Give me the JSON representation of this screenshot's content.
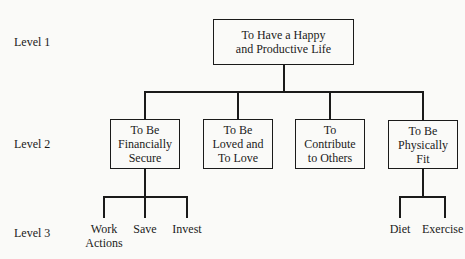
{
  "levels": [
    "Level 1",
    "Level 2",
    "Level 3"
  ],
  "root": {
    "label": "To Have a Happy\nand Productive Life"
  },
  "level2": [
    {
      "label": "To Be\nFinancially\nSecure"
    },
    {
      "label": "To Be\nLoved and\nTo Love"
    },
    {
      "label": "To\nContribute\nto Others"
    },
    {
      "label": "To Be\nPhysically\nFit"
    }
  ],
  "level3": {
    "financial": [
      {
        "label": "Work\nActions"
      },
      {
        "label": "Save"
      },
      {
        "label": "Invest"
      }
    ],
    "physical": [
      {
        "label": "Diet"
      },
      {
        "label": "Exercise"
      }
    ]
  }
}
